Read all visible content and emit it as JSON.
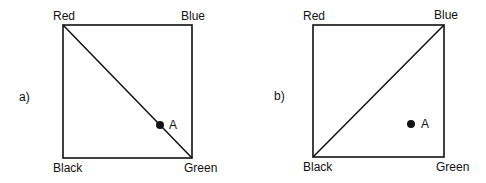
{
  "panels": [
    {
      "label": "a)",
      "corners": {
        "top_left": "Red",
        "top_right": "Blue",
        "bottom_left": "Black",
        "bottom_right": "Green"
      },
      "diagonal": "Red to Green",
      "point": {
        "label": "A",
        "position": "on diagonal, near Green"
      }
    },
    {
      "label": "b)",
      "corners": {
        "top_left": "Red",
        "top_right": "Blue",
        "bottom_left": "Black",
        "bottom_right": "Green"
      },
      "diagonal": "Black to Blue",
      "point": {
        "label": "A",
        "position": "below diagonal, toward Green"
      }
    }
  ],
  "colors": {
    "line": "#111111",
    "background": "#ffffff"
  }
}
